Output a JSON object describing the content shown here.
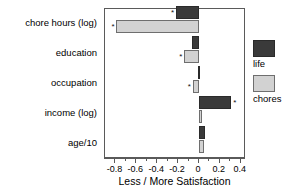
{
  "chart_data": {
    "type": "bar",
    "orientation": "horizontal",
    "title": "",
    "xlabel": "Less / More Satisfaction",
    "ylabel": "",
    "xlim": [
      -0.9,
      0.45
    ],
    "grid": false,
    "legend_position": "right",
    "categories": [
      "chore hours (log)",
      "education",
      "occupation",
      "income (log)",
      "age/10"
    ],
    "xticks": [
      -0.8,
      -0.6,
      -0.4,
      -0.2,
      0,
      0.2,
      0.4
    ],
    "xticklabels": [
      "-0.8",
      "-0.6",
      "-0.4",
      "-0.2",
      "0",
      "0.2",
      "0.4"
    ],
    "series": [
      {
        "name": "life",
        "color": "#3a3a3a",
        "values": [
          -0.22,
          -0.07,
          -0.012,
          0.31,
          0.06
        ],
        "significant": [
          true,
          false,
          false,
          true,
          false
        ]
      },
      {
        "name": "chores",
        "color": "#d2d2d2",
        "values": [
          -0.79,
          -0.14,
          -0.06,
          0.02,
          0.05
        ],
        "significant": [
          true,
          true,
          true,
          false,
          false
        ]
      }
    ],
    "significance_marker": "*"
  },
  "legend": {
    "items": [
      {
        "label": "life",
        "key": "life"
      },
      {
        "label": "chores",
        "key": "chores"
      }
    ]
  }
}
